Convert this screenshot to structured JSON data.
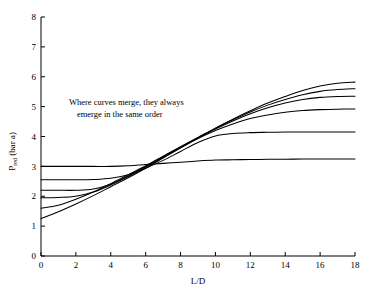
{
  "chart_data": {
    "type": "line",
    "title": "",
    "xlabel": "L/D",
    "ylabel": "P_red (bar a)",
    "ylabel_main": "P",
    "ylabel_sub": "red",
    "ylabel_unit": " (bar a)",
    "xlim": [
      0,
      18
    ],
    "ylim": [
      0,
      8
    ],
    "xticks": [
      0,
      2,
      4,
      6,
      8,
      10,
      12,
      14,
      16,
      18
    ],
    "yticks": [
      0,
      1,
      2,
      3,
      4,
      5,
      6,
      7,
      8
    ],
    "xticklabels": [
      "0",
      "2",
      "4",
      "6",
      "8",
      "10",
      "12",
      "14",
      "16",
      "18"
    ],
    "yticklabels": [
      "0",
      "1",
      "2",
      "3",
      "4",
      "5",
      "6",
      "7",
      "8"
    ],
    "grid": false,
    "legend": "none",
    "annotations": [
      {
        "text_line1": "Where curves merge, they always",
        "text_line2": "emerge in the same order",
        "x": 1.6,
        "y": 5.05
      }
    ],
    "x": [
      0,
      1,
      2,
      3,
      4,
      5,
      6,
      7,
      8,
      9,
      10,
      11,
      12,
      13,
      14,
      15,
      16,
      17,
      18
    ],
    "series": [
      {
        "name": "curve-1",
        "start": 3.0,
        "end": 3.25,
        "values": [
          3.0,
          3.0,
          3.0,
          3.0,
          3.0,
          3.02,
          3.06,
          3.1,
          3.14,
          3.18,
          3.21,
          3.22,
          3.23,
          3.235,
          3.24,
          3.245,
          3.248,
          3.25,
          3.25
        ]
      },
      {
        "name": "curve-2",
        "start": 2.55,
        "end": 4.15,
        "values": [
          2.55,
          2.55,
          2.55,
          2.56,
          2.6,
          2.72,
          2.94,
          3.2,
          3.5,
          3.8,
          4.02,
          4.1,
          4.13,
          4.14,
          4.15,
          4.15,
          4.15,
          4.15,
          4.15
        ]
      },
      {
        "name": "curve-3",
        "start": 2.2,
        "end": 4.92,
        "values": [
          2.2,
          2.2,
          2.2,
          2.24,
          2.4,
          2.66,
          2.98,
          3.3,
          3.62,
          3.93,
          4.2,
          4.42,
          4.6,
          4.72,
          4.81,
          4.87,
          4.9,
          4.915,
          4.92
        ]
      },
      {
        "name": "curve-4",
        "start": 1.95,
        "end": 5.35,
        "values": [
          1.95,
          1.96,
          2.0,
          2.14,
          2.38,
          2.68,
          3.0,
          3.32,
          3.64,
          3.95,
          4.25,
          4.52,
          4.76,
          4.96,
          5.12,
          5.24,
          5.31,
          5.34,
          5.35
        ]
      },
      {
        "name": "curve-5",
        "start": 1.6,
        "end": 5.6,
        "values": [
          1.6,
          1.7,
          1.9,
          2.14,
          2.42,
          2.72,
          3.02,
          3.34,
          3.66,
          3.97,
          4.28,
          4.56,
          4.82,
          5.05,
          5.24,
          5.4,
          5.51,
          5.57,
          5.6
        ]
      },
      {
        "name": "curve-6",
        "start": 1.25,
        "end": 5.82,
        "values": [
          1.25,
          1.48,
          1.74,
          2.02,
          2.32,
          2.62,
          2.94,
          3.28,
          3.62,
          3.95,
          4.28,
          4.58,
          4.86,
          5.12,
          5.34,
          5.54,
          5.69,
          5.78,
          5.82
        ]
      }
    ]
  },
  "axes": {
    "x_title": "L/D",
    "y_title_main": "P",
    "y_title_sub": "red",
    "y_title_unit": " (bar a)"
  },
  "annotation": {
    "line1": "Where curves merge, they always",
    "line2": "emerge in the same order"
  },
  "colors": {
    "curve": "#000000",
    "axis": "#000000",
    "background": "#ffffff"
  }
}
